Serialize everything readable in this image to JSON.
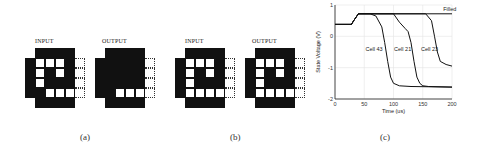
{
  "panels": [
    {
      "id": "a",
      "caption": "(a)",
      "input": {
        "label": "INPUT",
        "rows": [
          "xbbbbx",
          "bwwwbd",
          "bwbwbd",
          "bwbbbd",
          "bbwwwd",
          "xbbbbx"
        ]
      },
      "output": {
        "label": "OUTPUT",
        "rows": [
          "xbbbbx",
          "bbbbbd",
          "bbbbbd",
          "bbbbbd",
          "bbwwwd",
          "xbbbbx"
        ]
      }
    },
    {
      "id": "b",
      "caption": "(b)",
      "input": {
        "label": "INPUT",
        "rows": [
          "xbbbbx",
          "bwwwbd",
          "bwbwbd",
          "bwbbbd",
          "bwwwwd",
          "xbbbbx"
        ]
      },
      "output": {
        "label": "OUTPUT",
        "rows": [
          "xbbbbx",
          "bwwwbd",
          "bwbwbd",
          "bwbbbd",
          "bwwwwd",
          "xbbbbx"
        ]
      }
    }
  ],
  "chart_caption": "(c)",
  "chart_data": {
    "type": "line",
    "title": "",
    "xlabel": "Time (us)",
    "ylabel": "State Voltage (V)",
    "xlim": [
      0,
      200
    ],
    "ylim": [
      -2,
      1
    ],
    "xticks": [
      0,
      50,
      100,
      150,
      200
    ],
    "yticks": [
      -2,
      -1,
      0,
      1
    ],
    "grid": true,
    "series": [
      {
        "name": "Filled",
        "x": [
          0,
          28,
          32,
          40,
          200
        ],
        "y": [
          0.38,
          0.38,
          0.5,
          0.72,
          0.72
        ]
      },
      {
        "name": "Cell 43",
        "x": [
          0,
          28,
          32,
          40,
          60,
          70,
          80,
          85,
          90,
          95,
          100,
          110,
          130,
          200
        ],
        "y": [
          0.38,
          0.38,
          0.5,
          0.72,
          0.72,
          0.65,
          0.3,
          -0.2,
          -0.8,
          -1.3,
          -1.5,
          -1.58,
          -1.6,
          -1.62
        ]
      },
      {
        "name": "Cell 21",
        "x": [
          0,
          28,
          32,
          40,
          100,
          110,
          120,
          125,
          130,
          135,
          140,
          145,
          150,
          160,
          200
        ],
        "y": [
          0.38,
          0.38,
          0.5,
          0.72,
          0.72,
          0.45,
          0.25,
          0.15,
          -0.2,
          -0.8,
          -1.3,
          -1.5,
          -1.58,
          -1.6,
          -1.62
        ]
      },
      {
        "name": "Cell 23",
        "x": [
          0,
          28,
          32,
          40,
          155,
          165,
          170,
          175,
          180,
          190,
          200
        ],
        "y": [
          0.38,
          0.38,
          0.5,
          0.72,
          0.72,
          0.5,
          0.0,
          -0.5,
          -0.8,
          -0.9,
          -0.95
        ]
      }
    ],
    "annotations": [
      "Filled",
      "Cell 43",
      "Cell 21",
      "Cell 23"
    ]
  }
}
